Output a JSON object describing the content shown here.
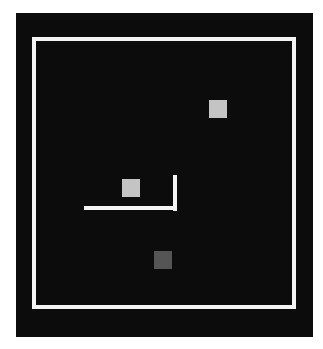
{
  "scene": {
    "background": "#ffffff",
    "panel": {
      "x": 16,
      "y": 13,
      "w": 297,
      "h": 324,
      "color": "#0c0c0c"
    },
    "frame": {
      "x": 32,
      "y": 37,
      "w": 264,
      "h": 272,
      "stroke": 4,
      "color": "#f4f4f4"
    },
    "squares": [
      {
        "id": "top-right",
        "x": 209,
        "y": 100,
        "size": 18,
        "color": "#c4c4c4"
      },
      {
        "id": "middle-left",
        "x": 122,
        "y": 179,
        "size": 18,
        "color": "#c4c4c4"
      },
      {
        "id": "bottom",
        "x": 154,
        "y": 251,
        "size": 18,
        "color": "#555555"
      }
    ],
    "l_wall": {
      "color": "#f4f4f4",
      "vertical": {
        "x": 173,
        "y": 175,
        "w": 4,
        "h": 36
      },
      "horizontal": {
        "x": 84,
        "y": 206,
        "w": 93,
        "h": 4
      }
    }
  }
}
